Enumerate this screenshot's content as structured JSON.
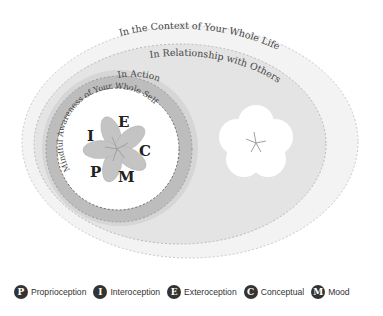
{
  "diagram": {
    "layers": {
      "context": {
        "label": "In the Context of Your Whole Life",
        "fill": "#f3f3f3"
      },
      "relationship": {
        "label": "In Relationship with Others",
        "fill": "#e4e4e4"
      },
      "action": {
        "label": "In Action",
        "fill_outer": "#d6d6d6",
        "fill_inner": "#bdbdbd"
      },
      "self": {
        "label": "Mindful Awareness of Your Whole Self",
        "fill": "#ffffff"
      }
    },
    "self_letters": {
      "e": "E",
      "i": "I",
      "c": "C",
      "p": "P",
      "m": "M"
    },
    "flower_color": "#c4c4c4",
    "others_flower_color": "#ffffff"
  },
  "legend": {
    "items": [
      {
        "letter": "P",
        "label": "Proprioception"
      },
      {
        "letter": "I",
        "label": "Interoception"
      },
      {
        "letter": "E",
        "label": "Exteroception"
      },
      {
        "letter": "C",
        "label": "Conceptual"
      },
      {
        "letter": "M",
        "label": "Mood"
      }
    ]
  }
}
